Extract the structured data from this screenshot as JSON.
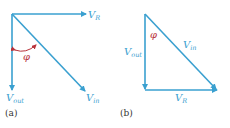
{
  "colors": {
    "vector": "#3aa0d0",
    "angle": "#b8323a",
    "caption": "#333333"
  },
  "panel_a": {
    "caption": "(a)",
    "vectors": [
      {
        "name": "V_R",
        "main": "V",
        "sub": "R"
      },
      {
        "name": "V_out",
        "main": "V",
        "sub": "out"
      },
      {
        "name": "V_in",
        "main": "V",
        "sub": "in"
      }
    ],
    "angle_label": "φ"
  },
  "panel_b": {
    "caption": "(b)",
    "vectors": [
      {
        "name": "V_out",
        "main": "V",
        "sub": "out"
      },
      {
        "name": "V_in",
        "main": "V",
        "sub": "in"
      },
      {
        "name": "V_R",
        "main": "V",
        "sub": "R"
      }
    ],
    "angle_label": "φ"
  }
}
